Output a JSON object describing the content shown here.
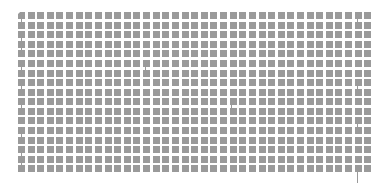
{
  "page": {
    "background_color": "#ffffff",
    "width": 384,
    "height": 191
  },
  "document": {
    "appearance": "illegible-downscaled-text",
    "block_color": "#9a9a9a",
    "descender_color": "#9a9a9a",
    "grid": {
      "origin_x": 18,
      "origin_y": 12,
      "col_pitch": 9.62,
      "row_pitch": 9.62,
      "block_width": 7,
      "block_height": 7,
      "columns": 37,
      "rows": 18
    },
    "lines": [
      {
        "index": 0,
        "y": 12,
        "blocks": 37,
        "first_block_clipped": true
      },
      {
        "index": 1,
        "y": 22,
        "blocks": 37,
        "first_block_clipped": false
      },
      {
        "index": 2,
        "y": 31,
        "blocks": 37,
        "first_block_clipped": false
      },
      {
        "index": 3,
        "y": 41,
        "blocks": 37,
        "first_block_clipped": false
      },
      {
        "index": 4,
        "y": 50,
        "blocks": 37,
        "first_block_clipped": false
      },
      {
        "index": 5,
        "y": 60,
        "blocks": 37,
        "first_block_clipped": false
      },
      {
        "index": 6,
        "y": 70,
        "blocks": 37,
        "first_block_clipped": false
      },
      {
        "index": 7,
        "y": 79,
        "blocks": 37,
        "first_block_clipped": false
      },
      {
        "index": 8,
        "y": 89,
        "blocks": 37,
        "first_block_clipped": false
      },
      {
        "index": 9,
        "y": 98,
        "blocks": 37,
        "first_block_clipped": false
      },
      {
        "index": 10,
        "y": 108,
        "blocks": 37,
        "first_block_clipped": false
      },
      {
        "index": 11,
        "y": 117,
        "blocks": 37,
        "first_block_clipped": false
      },
      {
        "index": 12,
        "y": 127,
        "blocks": 37,
        "first_block_clipped": false
      },
      {
        "index": 13,
        "y": 137,
        "blocks": 37,
        "first_block_clipped": false
      },
      {
        "index": 14,
        "y": 146,
        "blocks": 37,
        "first_block_clipped": false
      },
      {
        "index": 15,
        "y": 156,
        "blocks": 37,
        "first_block_clipped": false
      },
      {
        "index": 16,
        "y": 165,
        "blocks": 37,
        "first_block_clipped": false
      },
      {
        "index": 17,
        "y": 170,
        "blocks": 0,
        "first_block_clipped": false
      }
    ],
    "descenders": [
      {
        "x": 21,
        "y": 19,
        "height": 9
      },
      {
        "x": 21,
        "y": 38,
        "height": 9
      },
      {
        "x": 21,
        "y": 48,
        "height": 9
      },
      {
        "x": 21,
        "y": 67,
        "height": 9
      },
      {
        "x": 21,
        "y": 86,
        "height": 9
      },
      {
        "x": 21,
        "y": 105,
        "height": 9
      },
      {
        "x": 21,
        "y": 134,
        "height": 9
      },
      {
        "x": 21,
        "y": 153,
        "height": 9
      },
      {
        "x": 21,
        "y": 163,
        "height": 9
      },
      {
        "x": 357,
        "y": 19,
        "height": 9
      },
      {
        "x": 357,
        "y": 86,
        "height": 9
      },
      {
        "x": 357,
        "y": 124,
        "height": 9
      },
      {
        "x": 357,
        "y": 172,
        "height": 11
      },
      {
        "x": 145,
        "y": 67,
        "height": 7
      },
      {
        "x": 231,
        "y": 105,
        "height": 7
      }
    ]
  }
}
